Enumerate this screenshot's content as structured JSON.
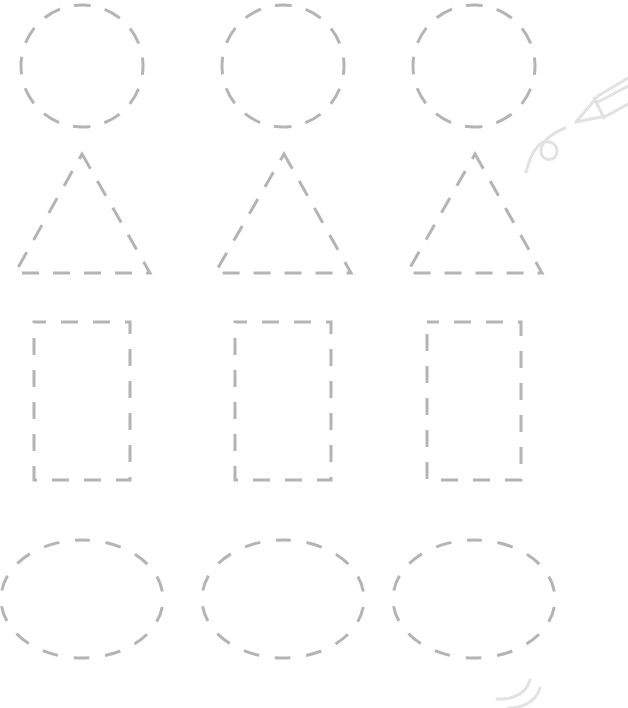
{
  "worksheet": {
    "type": "shape-tracing",
    "stroke_color": "#b4b4b4",
    "decoration_color": "#e2e2e2",
    "background_color": "#ffffff",
    "rows": [
      {
        "shape": "circle",
        "items": [
          {
            "cx": 82,
            "cy": 66,
            "r": 61
          },
          {
            "cx": 283,
            "cy": 66,
            "r": 61
          },
          {
            "cx": 474,
            "cy": 66,
            "r": 61
          }
        ]
      },
      {
        "shape": "triangle",
        "items": [
          {
            "apex": [
              82,
              154
            ],
            "left": [
              15,
              273
            ],
            "right": [
              150,
              273
            ]
          },
          {
            "apex": [
              284,
              154
            ],
            "left": [
              215,
              273
            ],
            "right": [
              351,
              273
            ]
          },
          {
            "apex": [
              475,
              154
            ],
            "left": [
              407,
              273
            ],
            "right": [
              542,
              273
            ]
          }
        ]
      },
      {
        "shape": "rectangle",
        "items": [
          {
            "x": 34,
            "y": 322,
            "w": 96,
            "h": 158
          },
          {
            "x": 235,
            "y": 322,
            "w": 96,
            "h": 158
          },
          {
            "x": 427,
            "y": 322,
            "w": 94,
            "h": 158
          }
        ]
      },
      {
        "shape": "oval",
        "items": [
          {
            "cx": 82,
            "cy": 599,
            "rx": 59,
            "ry": 81
          },
          {
            "cx": 283,
            "cy": 599,
            "rx": 59,
            "ry": 81
          },
          {
            "cx": 474,
            "cy": 599,
            "rx": 59,
            "ry": 81
          }
        ]
      }
    ],
    "decorations": [
      "pencil-icon",
      "pencil-scribble",
      "motion-curl-lines"
    ]
  }
}
